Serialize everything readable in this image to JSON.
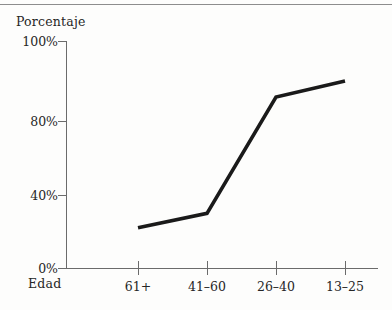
{
  "chart_data": {
    "type": "line",
    "title": "",
    "xlabel": "Edad",
    "ylabel": "Porcentaje",
    "categories": [
      "61+",
      "41–60",
      "26–40",
      "13–25"
    ],
    "values": [
      22,
      30,
      86,
      90
    ],
    "series": [
      {
        "name": "Porcentaje",
        "values": [
          22,
          30,
          86,
          90
        ]
      }
    ],
    "ytick_labels": [
      "0%",
      "40%",
      "80%",
      "100%"
    ],
    "ytick_values": [
      0,
      40,
      80,
      100
    ],
    "ylim": [
      0,
      100
    ],
    "grid": false,
    "legend": false,
    "line_color": "#1a1a1a",
    "axis_color": "#6b6b6b",
    "background_color": "#fdfdfc"
  },
  "figure": {
    "y_axis_title": "Porcentaje",
    "x_axis_title": "Edad",
    "top_rule_color": "#8d8d8d"
  }
}
